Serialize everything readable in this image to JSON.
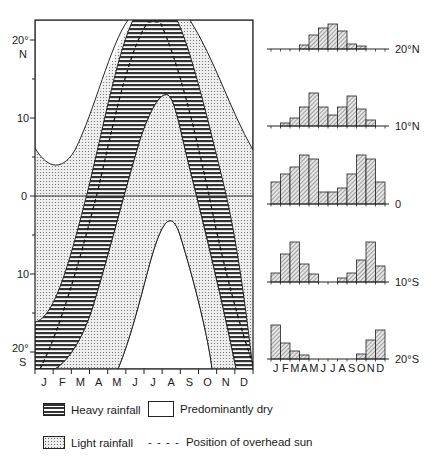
{
  "left_chart": {
    "y_axis_labels": [
      {
        "text": "20°",
        "sub": "N",
        "lat": 20
      },
      {
        "text": "10",
        "lat": 10
      },
      {
        "text": "0",
        "lat": 0
      },
      {
        "text": "10",
        "lat": -10
      },
      {
        "text": "20°",
        "sub": "S",
        "lat": -20
      }
    ],
    "months": [
      "J",
      "F",
      "M",
      "A",
      "M",
      "J",
      "J",
      "A",
      "S",
      "O",
      "N",
      "D"
    ]
  },
  "histograms": [
    {
      "label": "20°N",
      "values": [
        0,
        0,
        0,
        4,
        14,
        21,
        25,
        18,
        5,
        3,
        0,
        0
      ]
    },
    {
      "label": "10°N",
      "values": [
        0,
        3,
        8,
        19,
        33,
        19,
        11,
        19,
        30,
        17,
        6,
        0
      ]
    },
    {
      "label": "0",
      "values": [
        22,
        30,
        37,
        49,
        45,
        12,
        12,
        16,
        30,
        49,
        45,
        22
      ]
    },
    {
      "label": "10°S",
      "values": [
        9,
        28,
        40,
        18,
        8,
        0,
        0,
        4,
        9,
        22,
        40,
        16
      ]
    },
    {
      "label": "20°S",
      "values": [
        34,
        16,
        8,
        4,
        0,
        0,
        0,
        0,
        0,
        5,
        19,
        29
      ]
    }
  ],
  "histogram_months": [
    "J",
    "F",
    "M",
    "A",
    "M",
    "J",
    "J",
    "A",
    "S",
    "O",
    "N",
    "D"
  ],
  "legend": {
    "heavy": "Heavy rainfall",
    "dry": "Predominantly dry",
    "light": "Light rainfall",
    "sun": "Position of overhead sun",
    "sun_symbol": "- - - -"
  },
  "chart_data": {
    "type": "area",
    "title": "",
    "xlabel": "",
    "ylabel": "Latitude",
    "categories": [
      "J",
      "F",
      "M",
      "A",
      "M",
      "J",
      "J",
      "A",
      "S",
      "O",
      "N",
      "D"
    ],
    "ylim": [
      -22,
      22
    ],
    "series": [
      {
        "name": "Position of overhead sun (approx. lat)",
        "values": [
          -21,
          -13,
          -3,
          9,
          18,
          23,
          21,
          14,
          3,
          -8,
          -18,
          -23
        ]
      },
      {
        "name": "Heavy rainfall band northern edge",
        "values": [
          -15,
          -7,
          2,
          13,
          21,
          23,
          23,
          20,
          10,
          -1,
          -12,
          -17
        ]
      },
      {
        "name": "Heavy rainfall band southern edge",
        "values": [
          -22,
          -20,
          -12,
          -3,
          6,
          14,
          16,
          8,
          -3,
          -14,
          -22,
          -22
        ]
      }
    ],
    "histograms": [
      {
        "name": "20°N",
        "values": [
          0,
          0,
          0,
          4,
          14,
          21,
          25,
          18,
          5,
          3,
          0,
          0
        ]
      },
      {
        "name": "10°N",
        "values": [
          0,
          3,
          8,
          19,
          33,
          19,
          11,
          19,
          30,
          17,
          6,
          0
        ]
      },
      {
        "name": "0",
        "values": [
          22,
          30,
          37,
          49,
          45,
          12,
          12,
          16,
          30,
          49,
          45,
          22
        ]
      },
      {
        "name": "10°S",
        "values": [
          9,
          28,
          40,
          18,
          8,
          0,
          0,
          4,
          9,
          22,
          40,
          16
        ]
      },
      {
        "name": "20°S",
        "values": [
          34,
          16,
          8,
          4,
          0,
          0,
          0,
          0,
          0,
          5,
          19,
          29
        ]
      }
    ],
    "legend": [
      "Heavy rainfall",
      "Predominantly dry",
      "Light rainfall",
      "Position of overhead sun"
    ]
  }
}
